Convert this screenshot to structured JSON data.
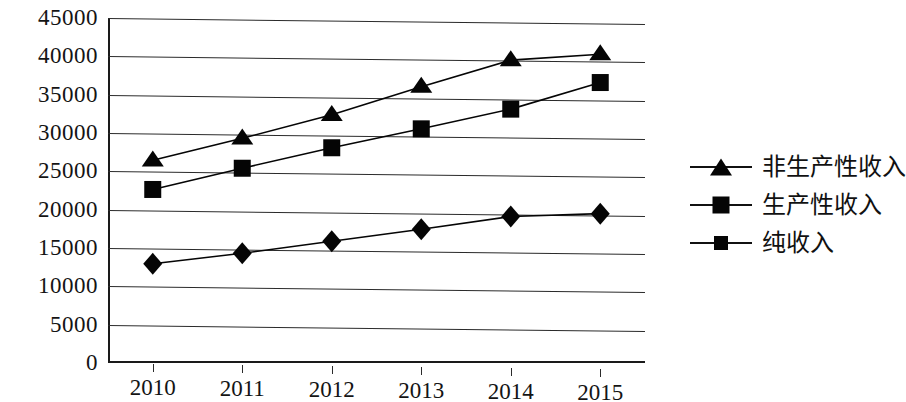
{
  "chart_data": {
    "type": "line",
    "title": "",
    "xlabel": "",
    "ylabel": "",
    "categories": [
      "2010",
      "2011",
      "2012",
      "2013",
      "2014",
      "2015"
    ],
    "ylim": [
      0,
      45000
    ],
    "ytick_step": 5000,
    "yticks": [
      "0",
      "5000",
      "10000",
      "15000",
      "20000",
      "25000",
      "30000",
      "35000",
      "40000",
      "45000"
    ],
    "grid": true,
    "legend_position": "right",
    "series": [
      {
        "name": "非生产性收入",
        "marker": "triangle",
        "color": "#050505",
        "values": [
          26500,
          29500,
          32700,
          36500,
          40100,
          41000
        ]
      },
      {
        "name": "生产性收入",
        "marker": "square",
        "color": "#050505",
        "values": [
          22700,
          25600,
          28400,
          31000,
          33700,
          37300
        ]
      },
      {
        "name": "纯收入",
        "marker": "diamond",
        "color": "#050505",
        "values": [
          13000,
          14500,
          16200,
          17900,
          19700,
          20200
        ]
      }
    ]
  },
  "legend": {
    "items": [
      {
        "label": "非生产性收入",
        "marker": "triangle"
      },
      {
        "label": "生产性收入",
        "marker": "square"
      },
      {
        "label": "纯收入",
        "marker": "diamond"
      }
    ]
  }
}
